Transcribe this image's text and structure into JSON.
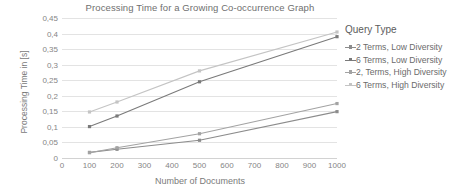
{
  "chart_data": {
    "type": "line",
    "title": "Processing Time for a Growing Co-occurrence Graph",
    "xlabel": "Number of Documents",
    "ylabel": "Processing Time in [s]",
    "legend_title": "Query Type",
    "legend_position": "right",
    "grid": true,
    "xlim": [
      0,
      1000
    ],
    "ylim": [
      0,
      0.45
    ],
    "x": [
      100,
      200,
      500,
      1000
    ],
    "xticks": [
      0,
      100,
      200,
      300,
      400,
      500,
      600,
      700,
      800,
      900,
      1000
    ],
    "xtick_labels": [
      "0",
      "100",
      "200",
      "300",
      "400",
      "500",
      "600",
      "700",
      "800",
      "900",
      "1000"
    ],
    "yticks": [
      0,
      0.05,
      0.1,
      0.15,
      0.2,
      0.25,
      0.3,
      0.35,
      0.4,
      0.45
    ],
    "ytick_labels": [
      "0",
      "0,05",
      "0,1",
      "0,15",
      "0,2",
      "0,25",
      "0,3",
      "0,35",
      "0,4",
      "0,45"
    ],
    "series": [
      {
        "name": "2 Terms, Low Diversity",
        "color": "#8c8c8c",
        "values": [
          0.018,
          0.028,
          0.057,
          0.149
        ]
      },
      {
        "name": "6 Terms, Low Diversity",
        "color": "#7a7a7a",
        "values": [
          0.101,
          0.135,
          0.245,
          0.39
        ]
      },
      {
        "name": "2, Terms, High Diversity",
        "color": "#a3a3a3",
        "values": [
          0.017,
          0.033,
          0.078,
          0.175
        ]
      },
      {
        "name": "6 Terms, High Diversity",
        "color": "#c4c4c4",
        "values": [
          0.148,
          0.18,
          0.28,
          0.405
        ]
      }
    ]
  }
}
